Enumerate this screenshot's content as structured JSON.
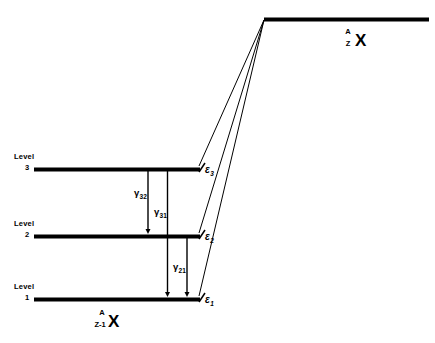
{
  "figure": {
    "background_color": "#ffffff",
    "line_color": "#000000",
    "width": 435,
    "height": 343
  },
  "parent": {
    "symbol": "X",
    "mass_number": "A",
    "atomic_number": "Z"
  },
  "daughter": {
    "symbol": "X",
    "mass_number": "A",
    "atomic_number": "Z-1"
  },
  "levels": [
    {
      "name_line1": "Level",
      "name_line2": "3",
      "energy_symbol": "ε",
      "energy_sub": "3"
    },
    {
      "name_line1": "Level",
      "name_line2": "2",
      "energy_symbol": "ε",
      "energy_sub": "2"
    },
    {
      "name_line1": "Level",
      "name_line2": "1",
      "energy_symbol": "ε",
      "energy_sub": "1"
    }
  ],
  "transitions": [
    {
      "symbol": "γ",
      "sub": "32",
      "from_level": "3",
      "to_level": "2"
    },
    {
      "symbol": "γ",
      "sub": "31",
      "from_level": "3",
      "to_level": "1"
    },
    {
      "symbol": "γ",
      "sub": "21",
      "from_level": "2",
      "to_level": "1"
    }
  ]
}
